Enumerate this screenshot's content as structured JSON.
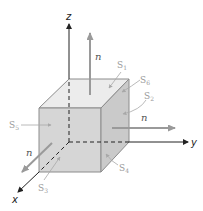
{
  "diagram": {
    "type": "cube-surface-normals",
    "axes": [
      {
        "name": "z",
        "label": "z"
      },
      {
        "name": "y",
        "label": "y"
      },
      {
        "name": "x",
        "label": "x"
      }
    ],
    "normals": [
      {
        "face": "top",
        "label": "n"
      },
      {
        "face": "right",
        "label": "n"
      },
      {
        "face": "front",
        "label": "n"
      }
    ],
    "surfaces": [
      {
        "id": "S1",
        "base": "S",
        "sub": "1"
      },
      {
        "id": "S2",
        "base": "S",
        "sub": "2"
      },
      {
        "id": "S3",
        "base": "S",
        "sub": "3"
      },
      {
        "id": "S4",
        "base": "S",
        "sub": "4"
      },
      {
        "id": "S5",
        "base": "S",
        "sub": "5"
      },
      {
        "id": "S6",
        "base": "S",
        "sub": "6"
      }
    ],
    "colors": {
      "axis": "#222222",
      "arrow": "#9a9a9a",
      "edge": "#8c8c8c",
      "face_top": "#ececec",
      "face_front": "#d4d4d4",
      "face_right": "#c8c8c8",
      "label_s": "#9a9a9a"
    }
  }
}
